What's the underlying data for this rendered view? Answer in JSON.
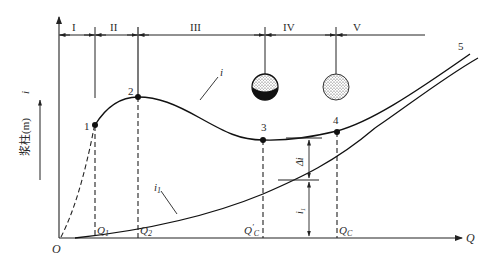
{
  "diagram": {
    "type": "pipeline slurry flow regime characteristic curve",
    "axes": {
      "x_label": "Q",
      "origin_label": "O",
      "y_label_text": "浆柱(m)",
      "y_label_symbol": "i"
    },
    "regions": [
      {
        "id": "I",
        "label": "I"
      },
      {
        "id": "II",
        "label": "II"
      },
      {
        "id": "III",
        "label": "III"
      },
      {
        "id": "IV",
        "label": "IV"
      },
      {
        "id": "V",
        "label": "V"
      }
    ],
    "points": [
      {
        "id": "1",
        "label": "1"
      },
      {
        "id": "2",
        "label": "2"
      },
      {
        "id": "3",
        "label": "3"
      },
      {
        "id": "4",
        "label": "4"
      },
      {
        "id": "5",
        "label": "5"
      }
    ],
    "curves": {
      "slurry": {
        "label": "i"
      },
      "clear_water": {
        "label": "i",
        "subscript": "1"
      }
    },
    "flow_marks": [
      {
        "id": "Q1",
        "main": "Q",
        "sub": "1"
      },
      {
        "id": "Q2",
        "main": "Q",
        "sub": "2"
      },
      {
        "id": "Qc_prime",
        "main": "Q",
        "prime": "′",
        "sub": "C"
      },
      {
        "id": "Qc",
        "main": "Q",
        "sub": "C"
      }
    ],
    "dimensions": {
      "delta_i": {
        "main": "Δi"
      },
      "i1": {
        "main": "i",
        "sub": "1"
      }
    },
    "particle_states": [
      {
        "id": "sphere-3",
        "description": "partially deposited (bottom dark layer)"
      },
      {
        "id": "sphere-4",
        "description": "fully suspended (uniform dots)"
      }
    ]
  }
}
